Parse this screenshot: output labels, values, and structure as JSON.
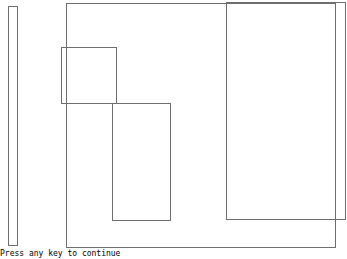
{
  "screen": {
    "background": "#ffffff",
    "line_color": "#6e6e6e"
  },
  "shapes": [
    {
      "id": "left-bar",
      "x": 8,
      "y": 6,
      "w": 10,
      "h": 240
    },
    {
      "id": "main-frame",
      "x": 66,
      "y": 3,
      "w": 270,
      "h": 245
    },
    {
      "id": "right-tall-box",
      "x": 226,
      "y": 2,
      "w": 120,
      "h": 218
    },
    {
      "id": "small-square",
      "x": 61,
      "y": 47,
      "w": 56,
      "h": 57
    },
    {
      "id": "middle-box",
      "x": 112,
      "y": 103,
      "w": 59,
      "h": 118
    }
  ],
  "prompt": {
    "text": "Press any key to continue"
  }
}
